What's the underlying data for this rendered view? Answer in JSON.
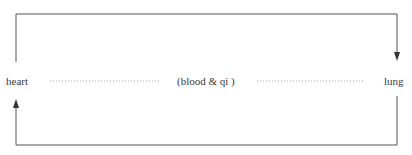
{
  "diagram": {
    "nodes": {
      "left": "heart",
      "middle": "(blood & qi )",
      "right": "lung"
    },
    "edges": [
      {
        "from": "heart",
        "to": "lung",
        "path": "top",
        "direction": "clockwise"
      },
      {
        "from": "lung",
        "to": "heart",
        "path": "bottom",
        "direction": "clockwise"
      }
    ],
    "colors": {
      "line": "#555555",
      "dotted": "#999999",
      "text": "#3a3a3a"
    }
  }
}
